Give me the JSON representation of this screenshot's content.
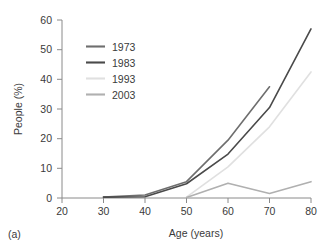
{
  "panel": {
    "label": "(a)"
  },
  "chart_data": {
    "type": "line",
    "title": "",
    "subtitle": "",
    "xlabel": "Age (years)",
    "ylabel": "People (%)",
    "xlim": [
      20,
      80
    ],
    "ylim": [
      0,
      60
    ],
    "xticks": [
      20,
      30,
      40,
      50,
      60,
      70,
      80
    ],
    "yticks": [
      0,
      10,
      20,
      30,
      40,
      50,
      60
    ],
    "xtick_labels": [
      "20",
      "30",
      "40",
      "50",
      "60",
      "70",
      "80"
    ],
    "ytick_labels": [
      "0",
      "10",
      "20",
      "30",
      "40",
      "50",
      "60"
    ],
    "grid": false,
    "legend_position": "upper-left-inside",
    "series": [
      {
        "name": "1973",
        "color": "#6e6e6e",
        "x": [
          30,
          40,
          50,
          60,
          70
        ],
        "values": [
          0.3,
          1.0,
          5.5,
          19.5,
          37.5
        ]
      },
      {
        "name": "1983",
        "color": "#4a4a4a",
        "x": [
          30,
          40,
          50,
          60,
          70,
          80
        ],
        "values": [
          0.3,
          0.4,
          4.8,
          14.8,
          30.5,
          57.0
        ]
      },
      {
        "name": "1993",
        "color": "#e0e0e0",
        "x": [
          50,
          60,
          70,
          80
        ],
        "values": [
          0.3,
          10.5,
          24.0,
          42.5
        ]
      },
      {
        "name": "2003",
        "color": "#b0b0b0",
        "x": [
          50,
          60,
          70,
          80
        ],
        "values": [
          0.2,
          5.0,
          1.5,
          5.5
        ]
      }
    ]
  },
  "legend": {
    "entries": [
      {
        "label": "1973",
        "color": "#6e6e6e"
      },
      {
        "label": "1983",
        "color": "#4a4a4a"
      },
      {
        "label": "1993",
        "color": "#e0e0e0"
      },
      {
        "label": "2003",
        "color": "#b0b0b0"
      }
    ]
  }
}
